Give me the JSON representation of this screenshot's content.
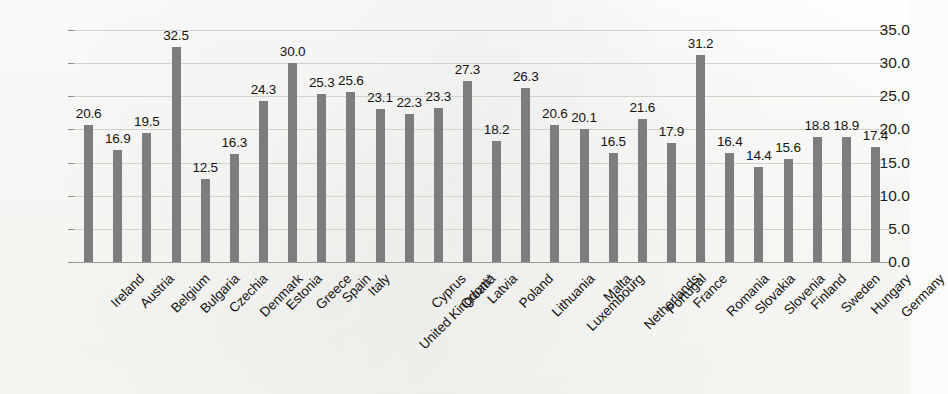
{
  "chart_data": {
    "type": "bar",
    "title": "",
    "subtitle": "",
    "xlabel": "",
    "ylabel": "",
    "ylim": [
      0.0,
      35.0
    ],
    "ytick_step": 5.0,
    "ytick_labels": [
      "0.0",
      "5.0",
      "10.0",
      "15.0",
      "20.0",
      "25.0",
      "30.0",
      "35.0"
    ],
    "ytick_values": [
      0.0,
      5.0,
      10.0,
      15.0,
      20.0,
      25.0,
      30.0,
      35.0
    ],
    "grid": true,
    "grid_axis": "y",
    "legend": false,
    "legend_position": "none",
    "bar_color": "#7d7d7d",
    "data_labels": true,
    "data_label_format": "one-decimal",
    "categories": [
      "Ireland",
      "Austria",
      "Belgium",
      "Bulgaria",
      "Czechia",
      "Denmark",
      "Estonia",
      "Greece",
      "Spain",
      "Italy",
      "United Kingdom*",
      "Cyprus",
      "Croatia",
      "Latvia",
      "Poland",
      "Lithuania",
      "Luxembourg",
      "Malta",
      "Netherlands",
      "Portugal",
      "France",
      "Romania",
      "Slovakia",
      "Slovenia",
      "Finland",
      "Sweden",
      "Hungary",
      "Germany"
    ],
    "values": [
      20.6,
      16.9,
      19.5,
      32.5,
      12.5,
      16.3,
      24.3,
      30.0,
      25.3,
      25.6,
      23.1,
      22.3,
      23.3,
      27.3,
      18.2,
      26.3,
      20.6,
      20.1,
      16.5,
      21.6,
      17.9,
      31.2,
      16.4,
      14.4,
      15.6,
      18.8,
      18.9,
      17.4
    ],
    "value_labels": [
      "20.6",
      "16.9",
      "19.5",
      "32.5",
      "12.5",
      "16.3",
      "24.3",
      "30.0",
      "25.3",
      "25.6",
      "23.1",
      "22.3",
      "23.3",
      "27.3",
      "18.2",
      "26.3",
      "20.6",
      "20.1",
      "16.5",
      "21.6",
      "17.9",
      "31.2",
      "16.4",
      "14.4",
      "15.6",
      "18.8",
      "18.9",
      "17.4"
    ]
  }
}
